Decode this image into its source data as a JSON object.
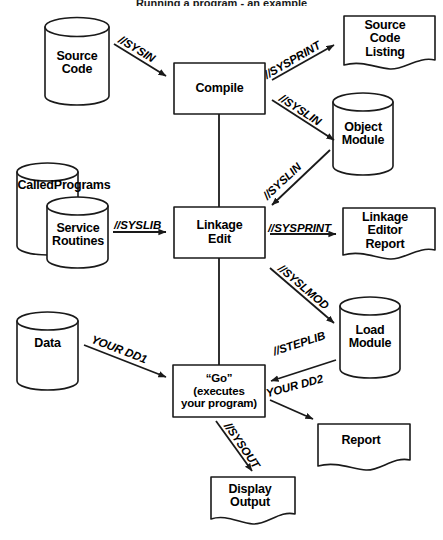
{
  "title": "Running a program  -  an example",
  "colors": {
    "stroke": "#1a1a1a",
    "fill": "#ffffff",
    "text": "#000000"
  },
  "nodes": {
    "source_code": {
      "label": "Source\nCode",
      "shape": "cylinder"
    },
    "compile": {
      "label": "Compile",
      "shape": "process"
    },
    "source_code_listing": {
      "label": "Source\nCode\nListing",
      "shape": "document"
    },
    "object_module": {
      "label": "Object\nModule",
      "shape": "cylinder"
    },
    "called_programs": {
      "label": "CalledPrograms",
      "shape": "cylinder"
    },
    "service_routines": {
      "label": "Service\nRoutines",
      "shape": "cylinder"
    },
    "linkage_edit": {
      "label": "Linkage\nEdit",
      "shape": "process"
    },
    "linkage_editor_report": {
      "label": "Linkage\nEditor\nReport",
      "shape": "document"
    },
    "load_module": {
      "label": "Load\nModule",
      "shape": "cylinder"
    },
    "data": {
      "label": "Data",
      "shape": "cylinder"
    },
    "go": {
      "label": "“Go”\n(executes\nyour program)",
      "shape": "process"
    },
    "report": {
      "label": "Report",
      "shape": "document"
    },
    "display_output": {
      "label": "Display\nOutput",
      "shape": "document"
    }
  },
  "edges": [
    {
      "id": "sysin",
      "label": "//SYSIN",
      "from": "source_code",
      "to": "compile"
    },
    {
      "id": "sysprint1",
      "label": "//SYSPRINT",
      "from": "compile",
      "to": "source_code_listing"
    },
    {
      "id": "syslin1",
      "label": "//SYSLIN",
      "from": "compile",
      "to": "object_module"
    },
    {
      "id": "syslin2",
      "label": "//SYSLIN",
      "from": "object_module",
      "to": "linkage_edit"
    },
    {
      "id": "syslib",
      "label": "//SYSLIB",
      "from": "service_routines",
      "to": "linkage_edit"
    },
    {
      "id": "sysprint2",
      "label": "//SYSPRINT",
      "from": "linkage_edit",
      "to": "linkage_editor_report"
    },
    {
      "id": "syslmod",
      "label": "//SYSLMOD",
      "from": "linkage_edit",
      "to": "load_module"
    },
    {
      "id": "steplib",
      "label": "//STEPLIB",
      "from": "load_module",
      "to": "go"
    },
    {
      "id": "yourdd1",
      "label": "YOUR DD1",
      "from": "data",
      "to": "go"
    },
    {
      "id": "yourdd2",
      "label": "YOUR DD2",
      "from": "go",
      "to": "report"
    },
    {
      "id": "sysout",
      "label": "//SYSOUT",
      "from": "go",
      "to": "display_output"
    },
    {
      "id": "flow1",
      "label": "",
      "from": "compile",
      "to": "linkage_edit"
    },
    {
      "id": "flow2",
      "label": "",
      "from": "linkage_edit",
      "to": "go"
    }
  ]
}
